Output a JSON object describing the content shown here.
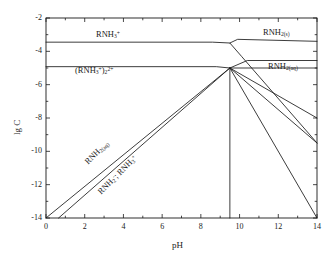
{
  "chart_data": {
    "type": "line",
    "title": "",
    "xlabel": "pH",
    "ylabel": "lg C",
    "xlim": [
      0,
      14
    ],
    "ylim": [
      -14,
      -2
    ],
    "xticks": [
      0,
      2,
      4,
      6,
      8,
      10,
      12,
      14
    ],
    "yticks": [
      -2,
      -4,
      -6,
      -8,
      -10,
      -12,
      -14
    ],
    "xtick_labels": [
      "0",
      "2",
      "4",
      "6",
      "8",
      "10",
      "12",
      "14"
    ],
    "ytick_labels": [
      "-2",
      "-4",
      "-6",
      "-8",
      "-10",
      "-12",
      "-14"
    ],
    "minor_xtick_step": 1,
    "minor_ytick_step": 1,
    "grid": false,
    "legend": "none",
    "node_point": [
      9.5,
      -5.0
    ],
    "series": [
      {
        "name": "RNH3+ plateau",
        "label_html": "RNH<sub>3</sub><sup>+</sup>",
        "points": [
          [
            0,
            -3.45
          ],
          [
            8.6,
            -3.45
          ],
          [
            9.5,
            -3.5
          ],
          [
            10.1,
            -4.3
          ],
          [
            14,
            -9.5
          ]
        ]
      },
      {
        "name": "(RNH3+)2 2+ plateau",
        "label_html": "(RNH<sub>3</sub><sup>+</sup>)<sub>2</sub><sup>2+</sup>",
        "points": [
          [
            0,
            -4.92
          ],
          [
            8.8,
            -4.92
          ],
          [
            9.5,
            -5.0
          ],
          [
            14,
            -5.0
          ]
        ]
      },
      {
        "name": "RNH2(s) branch",
        "label_html": "RNH<sub>2(s)</sub>",
        "points": [
          [
            9.5,
            -3.5
          ],
          [
            9.9,
            -3.28
          ],
          [
            14,
            -3.4
          ]
        ]
      },
      {
        "name": "RNH2(aq) plateau right",
        "label_html": "RNH<sub>2(aq)</sub>",
        "points": [
          [
            9.5,
            -5.0
          ],
          [
            10.4,
            -4.55
          ],
          [
            14,
            -4.55
          ]
        ]
      },
      {
        "name": "RNH2(aq) rising diagonal",
        "label_html": "RNH<sub>2(aq)</sub>",
        "points": [
          [
            0,
            -14.0
          ],
          [
            9.5,
            -5.0
          ]
        ]
      },
      {
        "name": "RNH2-; RNH3+ rising diagonal",
        "label_html": "RNH<sub>2</sub><sup>-</sup>; RNH<sub>3</sub><sup>+</sup>",
        "points": [
          [
            0.65,
            -14.0
          ],
          [
            9.5,
            -5.0
          ]
        ]
      },
      {
        "name": "vertical boundary at pH 9.5",
        "label_html": "",
        "points": [
          [
            9.5,
            -5.0
          ],
          [
            9.5,
            -14.0
          ]
        ]
      },
      {
        "name": "descending fan line upper",
        "label_html": "",
        "points": [
          [
            9.5,
            -5.0
          ],
          [
            14,
            -8.0
          ]
        ]
      },
      {
        "name": "descending fan line middle",
        "label_html": "",
        "points": [
          [
            9.5,
            -5.0
          ],
          [
            14,
            -9.5
          ]
        ]
      },
      {
        "name": "descending fan line lower",
        "label_html": "",
        "points": [
          [
            9.5,
            -5.0
          ],
          [
            14,
            -14.0
          ]
        ]
      }
    ],
    "annotations": [
      {
        "name": "rnh3-plus-label",
        "text_html": "RNH<sub>3</sub><sup>+</sup>",
        "x": 96,
        "y": 30,
        "rotation": 0
      },
      {
        "name": "rnh3-dimer-label",
        "text_html": "(RNH<sub>3</sub><sup>+</sup>)<sub>2</sub><sup>2+</sup>",
        "x": 75,
        "y": 66,
        "rotation": 0
      },
      {
        "name": "rnh2-solid-label",
        "text_html": "RNH<sub>2(s)</sub>",
        "x": 263,
        "y": 28,
        "rotation": 0
      },
      {
        "name": "rnh2-aqueous-label",
        "text_html": "RNH<sub>2(aq)</sub>",
        "x": 268,
        "y": 62,
        "rotation": 0
      },
      {
        "name": "rnh2-aq-diagonal-label",
        "text_html": "RNH<sub>2(aq)</sub>",
        "x": 90,
        "y": 157,
        "rotation": -45
      },
      {
        "name": "rnh2-minus-rnh3-label",
        "text_html": "RNH<sub>2</sub><sup>-</sup>; RNH<sub>3</sub><sup>+</sup>",
        "x": 103,
        "y": 187,
        "rotation": -45
      }
    ]
  },
  "axes": {
    "x_title": "pH",
    "y_title": "lg C"
  },
  "style": {
    "line_color": "#1a1a1a",
    "frame_color": "#1a1a1a",
    "background": "#ffffff"
  }
}
